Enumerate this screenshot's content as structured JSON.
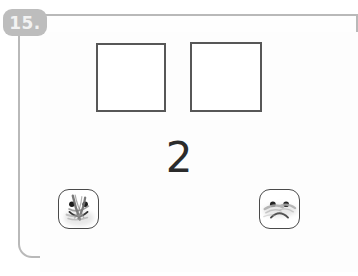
{
  "worksheet": {
    "item_number": "15.",
    "prompt_numeral": "2",
    "answer_boxes": [
      {
        "id": "box-1",
        "value": ""
      },
      {
        "id": "box-2",
        "value": ""
      }
    ],
    "face_options": [
      {
        "id": "happy",
        "icon": "happy-face-icon",
        "label": "Happy face",
        "state": "scribbled-out",
        "selected": false
      },
      {
        "id": "sad",
        "icon": "sad-face-icon",
        "label": "Sad face",
        "state": "lightly-marked",
        "selected": false
      }
    ]
  },
  "colors": {
    "card_border": "#b9b9b9",
    "badge_background": "#bdbdbd",
    "badge_text": "#f2f2f2",
    "box_border": "#575757",
    "numeral_text": "#2b2b2b",
    "face_border": "#4a4a4a",
    "pencil_mark": "#8f8f8f",
    "page_background": "#ffffff"
  }
}
